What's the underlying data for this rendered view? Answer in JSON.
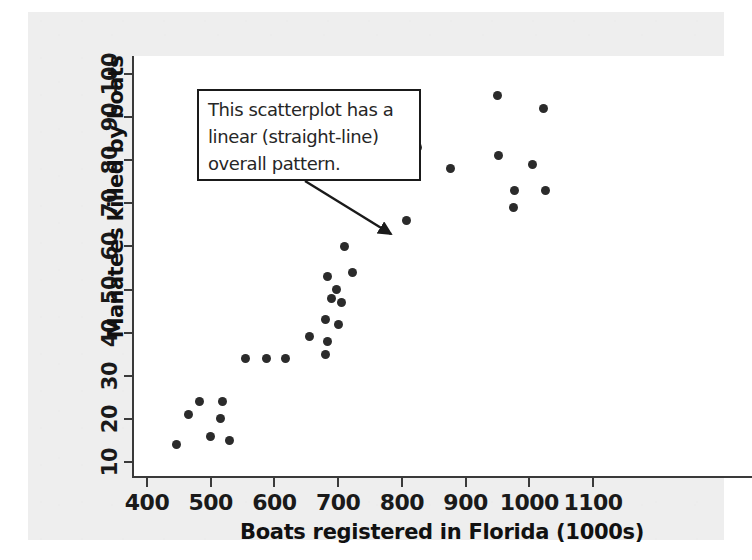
{
  "chart_data": {
    "type": "scatter",
    "title": "",
    "xlabel": "Boats registered in Florida (1000s)",
    "ylabel": "Manatees killed by boats",
    "xlim": [
      370,
      1135
    ],
    "ylim": [
      7,
      102
    ],
    "xticks": [
      400,
      500,
      600,
      700,
      800,
      900,
      1000,
      1100
    ],
    "yticks": [
      10,
      20,
      30,
      40,
      50,
      60,
      70,
      80,
      90,
      100
    ],
    "grid": false,
    "legend": null,
    "marker": "filled-circle",
    "marker_color": "#2b2b2b",
    "points": [
      {
        "x": 447,
        "y": 14
      },
      {
        "x": 465,
        "y": 21
      },
      {
        "x": 483,
        "y": 24
      },
      {
        "x": 500,
        "y": 16
      },
      {
        "x": 515,
        "y": 20
      },
      {
        "x": 518,
        "y": 24
      },
      {
        "x": 530,
        "y": 15
      },
      {
        "x": 555,
        "y": 34
      },
      {
        "x": 588,
        "y": 34
      },
      {
        "x": 618,
        "y": 34
      },
      {
        "x": 655,
        "y": 39
      },
      {
        "x": 680,
        "y": 35
      },
      {
        "x": 683,
        "y": 38
      },
      {
        "x": 680,
        "y": 43
      },
      {
        "x": 700,
        "y": 42
      },
      {
        "x": 684,
        "y": 53
      },
      {
        "x": 690,
        "y": 48
      },
      {
        "x": 697,
        "y": 50
      },
      {
        "x": 705,
        "y": 47
      },
      {
        "x": 722,
        "y": 54
      },
      {
        "x": 710,
        "y": 60
      },
      {
        "x": 808,
        "y": 66
      },
      {
        "x": 825,
        "y": 83
      },
      {
        "x": 877,
        "y": 78
      },
      {
        "x": 952,
        "y": 81
      },
      {
        "x": 950,
        "y": 95
      },
      {
        "x": 977,
        "y": 73
      },
      {
        "x": 975,
        "y": 69
      },
      {
        "x": 1005,
        "y": 79
      },
      {
        "x": 1022,
        "y": 92
      },
      {
        "x": 1025,
        "y": 73
      }
    ],
    "annotations": [
      {
        "name": "linear-pattern-callout",
        "lines": [
          "This scatterplot has a",
          "linear (straight-line)",
          "overall pattern."
        ],
        "points_to": {
          "x": 728,
          "y": 60
        }
      }
    ]
  },
  "axes": {
    "x": {
      "title": "Boats registered in Florida (1000s)",
      "tick_labels": [
        "400",
        "500",
        "600",
        "700",
        "800",
        "900",
        "1000",
        "1100"
      ]
    },
    "y": {
      "title": "Manatees killed by boats",
      "tick_labels": [
        "10",
        "20",
        "30",
        "40",
        "50",
        "60",
        "70",
        "80",
        "90",
        "100"
      ]
    }
  },
  "colors": {
    "page_background": "#ffffff",
    "panel_background": "#eeeeee",
    "plot_background": "#ffffff",
    "axis": "#3a3a3a",
    "text": "#111111",
    "marker": "#2b2b2b",
    "callout_border": "#1a1a1a"
  }
}
